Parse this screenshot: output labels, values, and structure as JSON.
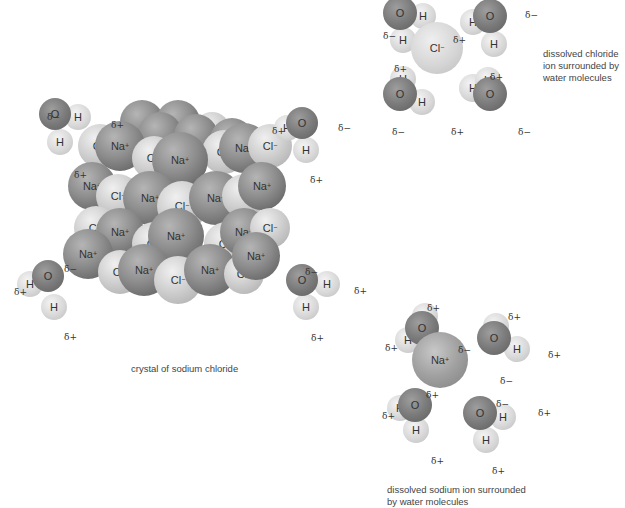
{
  "header_clipped_text": "Figure: dissolution of sodium chloride in water",
  "crystal": {
    "caption": "crystal of sodium chloride",
    "ions": [
      {
        "t": "na",
        "x": 142,
        "y": 122,
        "r": 22,
        "label": ""
      },
      {
        "t": "na",
        "x": 178,
        "y": 122,
        "r": 22,
        "label": ""
      },
      {
        "t": "cl",
        "x": 212,
        "y": 130,
        "r": 18,
        "label": ""
      },
      {
        "t": "na",
        "x": 160,
        "y": 134,
        "r": 22,
        "label": ""
      },
      {
        "t": "na",
        "x": 196,
        "y": 136,
        "r": 22,
        "label": ""
      },
      {
        "t": "na",
        "x": 232,
        "y": 140,
        "r": 22,
        "label": ""
      },
      {
        "t": "cl",
        "x": 100,
        "y": 146,
        "r": 22,
        "label": "Cl−"
      },
      {
        "t": "na",
        "x": 120,
        "y": 146,
        "r": 25,
        "label": "Na+"
      },
      {
        "t": "cl",
        "x": 154,
        "y": 158,
        "r": 22,
        "label": "Cl−"
      },
      {
        "t": "cl",
        "x": 224,
        "y": 152,
        "r": 22,
        "label": "Cl−"
      },
      {
        "t": "na",
        "x": 244,
        "y": 148,
        "r": 25,
        "label": "Na+"
      },
      {
        "t": "cl",
        "x": 270,
        "y": 146,
        "r": 22,
        "label": "Cl−"
      },
      {
        "t": "na",
        "x": 180,
        "y": 160,
        "r": 28,
        "label": "Na+"
      },
      {
        "t": "na",
        "x": 92,
        "y": 186,
        "r": 24,
        "label": "Na+"
      },
      {
        "t": "cl",
        "x": 118,
        "y": 196,
        "r": 22,
        "label": "Cl−"
      },
      {
        "t": "na",
        "x": 150,
        "y": 198,
        "r": 27,
        "label": "Na+"
      },
      {
        "t": "cl",
        "x": 182,
        "y": 206,
        "r": 25,
        "label": "Cl−"
      },
      {
        "t": "na",
        "x": 216,
        "y": 198,
        "r": 27,
        "label": "Na+"
      },
      {
        "t": "cl",
        "x": 244,
        "y": 196,
        "r": 22,
        "label": ""
      },
      {
        "t": "na",
        "x": 262,
        "y": 186,
        "r": 24,
        "label": "Na+"
      },
      {
        "t": "cl",
        "x": 96,
        "y": 228,
        "r": 22,
        "label": "Cl−"
      },
      {
        "t": "na",
        "x": 120,
        "y": 232,
        "r": 24,
        "label": "Na+"
      },
      {
        "t": "cl",
        "x": 154,
        "y": 244,
        "r": 22,
        "label": "Cl−"
      },
      {
        "t": "cl",
        "x": 226,
        "y": 244,
        "r": 22,
        "label": "Cl−"
      },
      {
        "t": "na",
        "x": 244,
        "y": 232,
        "r": 24,
        "label": "Na+"
      },
      {
        "t": "cl",
        "x": 270,
        "y": 228,
        "r": 20,
        "label": "Cl−"
      },
      {
        "t": "na",
        "x": 176,
        "y": 236,
        "r": 28,
        "label": "Na+"
      },
      {
        "t": "na",
        "x": 88,
        "y": 254,
        "r": 25,
        "label": "Na+"
      },
      {
        "t": "cl",
        "x": 120,
        "y": 272,
        "r": 22,
        "label": "Cl−"
      },
      {
        "t": "na",
        "x": 144,
        "y": 270,
        "r": 26,
        "label": "Na+"
      },
      {
        "t": "cl",
        "x": 178,
        "y": 280,
        "r": 24,
        "label": "Cl−"
      },
      {
        "t": "na",
        "x": 210,
        "y": 270,
        "r": 26,
        "label": "Na+"
      },
      {
        "t": "cl",
        "x": 244,
        "y": 274,
        "r": 20,
        "label": "Cl−"
      },
      {
        "t": "na",
        "x": 256,
        "y": 256,
        "r": 24,
        "label": "Na+"
      }
    ]
  },
  "crystal_waters": [
    {
      "o": {
        "x": 55,
        "y": 114,
        "r": 16
      },
      "h": [
        {
          "x": 78,
          "y": 117,
          "r": 13
        },
        {
          "x": 60,
          "y": 142,
          "r": 13
        }
      ],
      "labels": {
        "o": "O",
        "h": "H"
      },
      "deltas": [
        {
          "x": 47,
          "y": 113,
          "text": "δ−"
        },
        {
          "x": 111,
          "y": 121,
          "text": "δ+"
        },
        {
          "x": 74,
          "y": 171,
          "text": "δ+"
        }
      ]
    },
    {
      "o": {
        "x": 302,
        "y": 123,
        "r": 16
      },
      "h": [
        {
          "x": 287,
          "y": 128,
          "r": 13
        },
        {
          "x": 306,
          "y": 150,
          "r": 13
        }
      ],
      "labels": {
        "o": "O",
        "h": "H"
      },
      "deltas": [
        {
          "x": 272,
          "y": 127,
          "text": "δ+"
        },
        {
          "x": 338,
          "y": 124,
          "text": "δ−"
        },
        {
          "x": 310,
          "y": 176,
          "text": "δ+"
        }
      ]
    },
    {
      "o": {
        "x": 48,
        "y": 276,
        "r": 16
      },
      "h": [
        {
          "x": 30,
          "y": 284,
          "r": 13
        },
        {
          "x": 54,
          "y": 307,
          "r": 13
        }
      ],
      "labels": {
        "o": "O",
        "h": "H"
      },
      "deltas": [
        {
          "x": 64,
          "y": 265,
          "text": "δ−"
        },
        {
          "x": 14,
          "y": 288,
          "text": "δ+"
        },
        {
          "x": 64,
          "y": 333,
          "text": "δ+"
        }
      ]
    },
    {
      "o": {
        "x": 302,
        "y": 280,
        "r": 16
      },
      "h": [
        {
          "x": 327,
          "y": 284,
          "r": 13
        },
        {
          "x": 306,
          "y": 307,
          "r": 13
        }
      ],
      "labels": {
        "o": "O",
        "h": "H"
      },
      "deltas": [
        {
          "x": 305,
          "y": 268,
          "text": "δ−"
        },
        {
          "x": 354,
          "y": 287,
          "text": "δ+"
        },
        {
          "x": 311,
          "y": 334,
          "text": "δ+"
        }
      ]
    }
  ],
  "chloride_panel": {
    "caption": [
      "dissolved chloride",
      "ion surrounded by",
      "water molecules"
    ],
    "ion": {
      "x": 437,
      "y": 48,
      "r": 26,
      "label": "Cl−"
    },
    "waters": [
      {
        "o": {
          "x": 400,
          "y": 13,
          "r": 17
        },
        "h": [
          {
            "x": 423,
            "y": 16,
            "r": 13
          },
          {
            "x": 403,
            "y": 40,
            "r": 13
          }
        ]
      },
      {
        "o": {
          "x": 490,
          "y": 16,
          "r": 17
        },
        "h": [
          {
            "x": 473,
            "y": 22,
            "r": 13
          },
          {
            "x": 494,
            "y": 44,
            "r": 13
          }
        ]
      },
      {
        "o": {
          "x": 400,
          "y": 94,
          "r": 17
        },
        "h": [
          {
            "x": 403,
            "y": 79,
            "r": 13
          },
          {
            "x": 422,
            "y": 102,
            "r": 13
          }
        ]
      },
      {
        "o": {
          "x": 490,
          "y": 94,
          "r": 17
        },
        "h": [
          {
            "x": 473,
            "y": 88,
            "r": 14
          },
          {
            "x": 488,
            "y": 80,
            "r": 13
          }
        ]
      }
    ],
    "labels": {
      "o": "O",
      "h": "H"
    },
    "deltas": [
      {
        "x": 383,
        "y": 32,
        "text": "δ−"
      },
      {
        "x": 453,
        "y": 36,
        "text": "δ+"
      },
      {
        "x": 525,
        "y": 11,
        "text": "δ−"
      },
      {
        "x": 394,
        "y": 65,
        "text": "δ+"
      },
      {
        "x": 490,
        "y": 73,
        "text": "δ+"
      },
      {
        "x": 392,
        "y": 128,
        "text": "δ−"
      },
      {
        "x": 451,
        "y": 128,
        "text": "δ+"
      },
      {
        "x": 518,
        "y": 128,
        "text": "δ−"
      }
    ]
  },
  "sodium_panel": {
    "caption": [
      "dissolved sodium ion surrounded",
      "by water molecules"
    ],
    "ion": {
      "x": 440,
      "y": 360,
      "r": 28,
      "label": "Na+"
    },
    "waters": [
      {
        "o": {
          "x": 422,
          "y": 328,
          "r": 17
        },
        "h": [
          {
            "x": 408,
            "y": 340,
            "r": 13
          },
          {
            "x": 425,
            "y": 316,
            "r": 13
          }
        ]
      },
      {
        "o": {
          "x": 494,
          "y": 338,
          "r": 17
        },
        "h": [
          {
            "x": 496,
            "y": 326,
            "r": 13
          },
          {
            "x": 517,
            "y": 349,
            "r": 13
          }
        ]
      },
      {
        "o": {
          "x": 415,
          "y": 405,
          "r": 17
        },
        "h": [
          {
            "x": 400,
            "y": 408,
            "r": 13
          },
          {
            "x": 416,
            "y": 430,
            "r": 13
          }
        ]
      },
      {
        "o": {
          "x": 480,
          "y": 413,
          "r": 17
        },
        "h": [
          {
            "x": 503,
            "y": 417,
            "r": 13
          },
          {
            "x": 486,
            "y": 440,
            "r": 13
          }
        ]
      }
    ],
    "labels": {
      "o": "O",
      "h": "H"
    },
    "deltas": [
      {
        "x": 427,
        "y": 304,
        "text": "δ+"
      },
      {
        "x": 508,
        "y": 313,
        "text": "δ+"
      },
      {
        "x": 385,
        "y": 344,
        "text": "δ+"
      },
      {
        "x": 458,
        "y": 346,
        "text": "δ−"
      },
      {
        "x": 548,
        "y": 351,
        "text": "δ+"
      },
      {
        "x": 500,
        "y": 377,
        "text": "δ−"
      },
      {
        "x": 426,
        "y": 391,
        "text": "δ+"
      },
      {
        "x": 496,
        "y": 400,
        "text": "δ−"
      },
      {
        "x": 538,
        "y": 409,
        "text": "δ+"
      },
      {
        "x": 382,
        "y": 412,
        "text": "δ+"
      },
      {
        "x": 431,
        "y": 457,
        "text": "δ+"
      },
      {
        "x": 492,
        "y": 467,
        "text": "δ+"
      }
    ]
  },
  "labels": {
    "crystal_caption": "crystal of sodium chloride",
    "chloride_caption_1": "dissolved chloride",
    "chloride_caption_2": "ion surrounded by",
    "chloride_caption_3": "water molecules",
    "sodium_caption_1": "dissolved sodium ion surrounded",
    "sodium_caption_2": "by water molecules"
  }
}
